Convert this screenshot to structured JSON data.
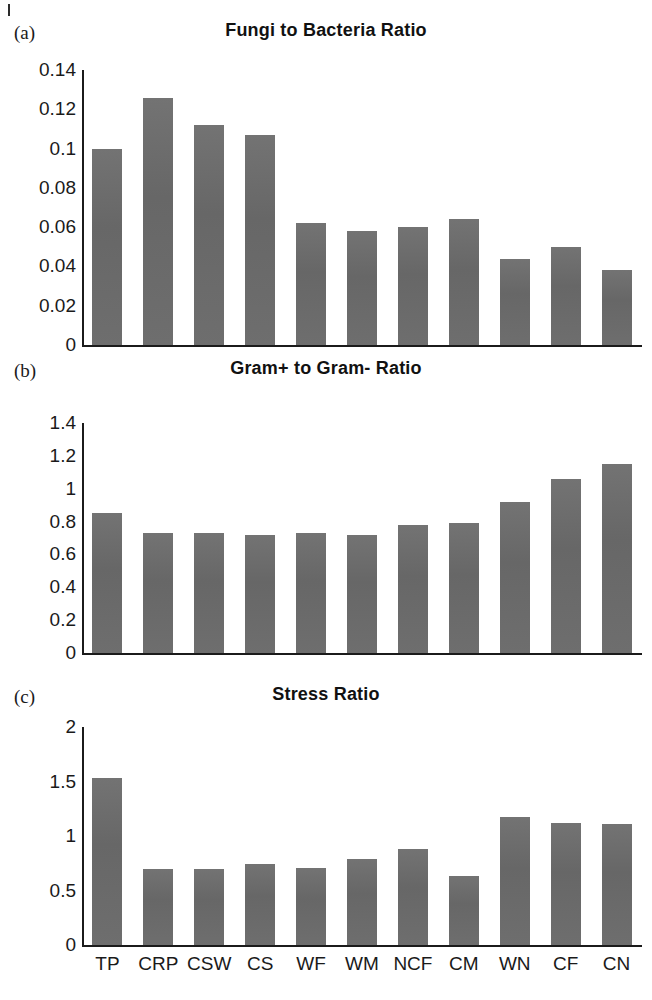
{
  "figure": {
    "panels": [
      {
        "letter": "(a)",
        "title": "Fungi to Bacteria Ratio",
        "yticks": [
          "0.14",
          "0.12",
          "0.1",
          "0.08",
          "0.06",
          "0.04",
          "0.02",
          "0"
        ]
      },
      {
        "letter": "(b)",
        "title": "Gram+ to Gram- Ratio",
        "yticks": [
          "1.4",
          "1.2",
          "1",
          "0.8",
          "0.6",
          "0.4",
          "0.2",
          "0"
        ]
      },
      {
        "letter": "(c)",
        "title": "Stress Ratio",
        "yticks": [
          "2",
          "1.5",
          "1",
          "0.5",
          "0"
        ]
      }
    ],
    "bar_color": "#6b6b6b",
    "axis_color": "#1b1b1b"
  },
  "chart_data": [
    {
      "type": "bar",
      "panel": "(a)",
      "title": "Fungi to Bacteria Ratio",
      "xlabel": "",
      "ylabel": "",
      "ylim": [
        0,
        0.14
      ],
      "ytick_values": [
        0,
        0.02,
        0.04,
        0.06,
        0.08,
        0.1,
        0.12,
        0.14
      ],
      "grid": false,
      "legend": "none",
      "categories": [
        "TP",
        "CRP",
        "CSW",
        "CS",
        "WF",
        "WM",
        "NCF",
        "CM",
        "WN",
        "CF",
        "CN"
      ],
      "values": [
        0.1,
        0.126,
        0.112,
        0.107,
        0.062,
        0.058,
        0.06,
        0.064,
        0.044,
        0.05,
        0.038
      ]
    },
    {
      "type": "bar",
      "panel": "(b)",
      "title": "Gram+ to Gram- Ratio",
      "xlabel": "",
      "ylabel": "",
      "ylim": [
        0,
        1.4
      ],
      "ytick_values": [
        0,
        0.2,
        0.4,
        0.6,
        0.8,
        1.0,
        1.2,
        1.4
      ],
      "grid": false,
      "legend": "none",
      "categories": [
        "TP",
        "CRP",
        "CSW",
        "CS",
        "WF",
        "WM",
        "NCF",
        "CM",
        "WN",
        "CF",
        "CN"
      ],
      "values": [
        0.85,
        0.73,
        0.73,
        0.72,
        0.73,
        0.72,
        0.78,
        0.79,
        0.92,
        1.06,
        1.15
      ]
    },
    {
      "type": "bar",
      "panel": "(c)",
      "title": "Stress Ratio",
      "xlabel": "",
      "ylabel": "",
      "ylim": [
        0,
        2
      ],
      "ytick_values": [
        0,
        0.5,
        1.0,
        1.5,
        2.0
      ],
      "grid": false,
      "legend": "none",
      "categories": [
        "TP",
        "CRP",
        "CSW",
        "CS",
        "WF",
        "WM",
        "NCF",
        "CM",
        "WN",
        "CF",
        "CN"
      ],
      "values": [
        1.53,
        0.7,
        0.7,
        0.74,
        0.71,
        0.79,
        0.88,
        0.63,
        1.17,
        1.12,
        1.11
      ]
    }
  ],
  "xaxis": {
    "labels": [
      "TP",
      "CRP",
      "CSW",
      "CS",
      "WF",
      "WM",
      "NCF",
      "CM",
      "WN",
      "CF",
      "CN"
    ]
  }
}
